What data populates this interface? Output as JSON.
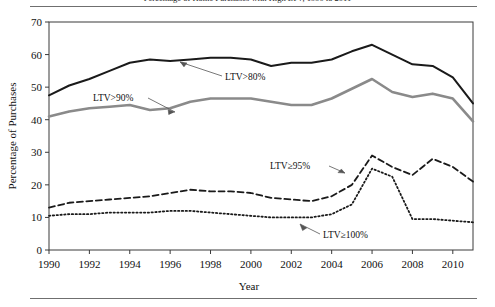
{
  "figure": {
    "title": "Percentage of Home Purchases with High LTV, 1990 to 2011",
    "axis_y_label": "Percentage of Purchases",
    "axis_x_label": "Year"
  },
  "annotations": {
    "ltv80": "LTV>80%",
    "ltv90": "LTV>90%",
    "ltv95": "LTV≥95%",
    "ltv100": "LTV≥100%"
  },
  "colors": {
    "ltv80": "#1a1a1a",
    "ltv90": "#8a8a8a",
    "ltv95": "#1a1a1a",
    "ltv100": "#1a1a1a",
    "frame": "#3a3a3a",
    "background": "#ffffff"
  },
  "chart_data": {
    "type": "line",
    "title": "Percentage of Home Purchases with High LTV, 1990 to 2011",
    "xlabel": "Year",
    "ylabel": "Percentage of Purchases",
    "xlim": [
      1990,
      2011
    ],
    "ylim": [
      0,
      70
    ],
    "yticks": [
      0,
      10,
      20,
      30,
      40,
      50,
      60,
      70
    ],
    "xticks": [
      1990,
      1992,
      1994,
      1996,
      1998,
      2000,
      2002,
      2004,
      2006,
      2008,
      2010
    ],
    "grid": false,
    "legend": "inline-annotations",
    "x": [
      1990,
      1991,
      1992,
      1993,
      1994,
      1995,
      1996,
      1997,
      1998,
      1999,
      2000,
      2001,
      2002,
      2003,
      2004,
      2005,
      2006,
      2007,
      2008,
      2009,
      2010,
      2011
    ],
    "series": [
      {
        "name": "LTV>80%",
        "style": "solid",
        "color": "#1a1a1a",
        "width": 2.0,
        "values": [
          47.5,
          50.5,
          52.5,
          55.0,
          57.5,
          58.5,
          58.0,
          58.5,
          59.0,
          59.0,
          58.5,
          56.5,
          57.5,
          57.5,
          58.5,
          61.0,
          63.0,
          60.0,
          57.0,
          56.5,
          53.0,
          45.0
        ]
      },
      {
        "name": "LTV>90%",
        "style": "solid",
        "color": "#8a8a8a",
        "width": 2.6,
        "values": [
          41.0,
          42.5,
          43.5,
          44.0,
          44.5,
          43.0,
          43.5,
          45.5,
          46.5,
          46.5,
          46.5,
          45.5,
          44.5,
          44.5,
          46.5,
          49.5,
          52.5,
          48.5,
          47.0,
          48.0,
          46.5,
          39.5
        ]
      },
      {
        "name": "LTV≥95%",
        "style": "dashed",
        "color": "#1a1a1a",
        "width": 1.8,
        "values": [
          13.0,
          14.5,
          15.0,
          15.5,
          16.0,
          16.5,
          17.5,
          18.5,
          18.0,
          18.0,
          17.5,
          16.0,
          15.5,
          15.0,
          16.5,
          20.0,
          29.0,
          25.5,
          23.0,
          28.0,
          25.5,
          21.0
        ]
      },
      {
        "name": "LTV≥100%",
        "style": "dotted",
        "color": "#1a1a1a",
        "width": 1.8,
        "values": [
          10.5,
          11.0,
          11.0,
          11.5,
          11.5,
          11.5,
          12.0,
          12.0,
          11.5,
          11.0,
          10.5,
          10.0,
          10.0,
          10.0,
          11.0,
          14.0,
          25.0,
          22.5,
          9.5,
          9.5,
          9.0,
          8.5
        ]
      }
    ]
  }
}
